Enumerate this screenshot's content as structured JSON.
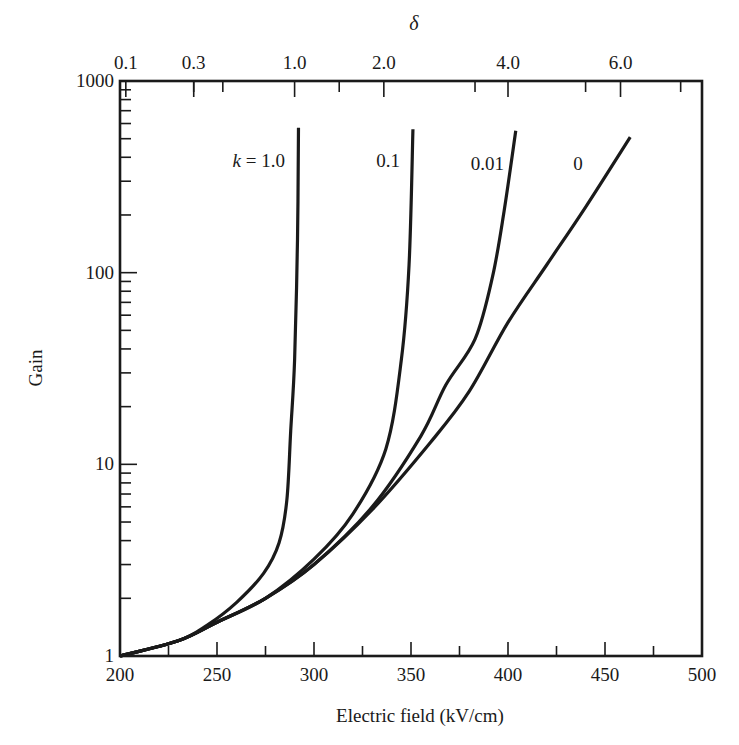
{
  "chart_data": {
    "type": "line",
    "title": "",
    "xlabel": "Electric field (kV/cm)",
    "ylabel": "Gain",
    "xlim": [
      200,
      500
    ],
    "ylim": [
      1,
      1000
    ],
    "yscale": "log",
    "grid": false,
    "legend": "inline labels near top of each curve",
    "x_ticks": [
      200,
      250,
      300,
      350,
      400,
      450,
      500
    ],
    "x_tick_labels": [
      "200",
      "250",
      "300",
      "350",
      "400",
      "450",
      "500"
    ],
    "y_ticks": [
      1,
      10,
      100,
      1000
    ],
    "y_tick_labels": [
      "1",
      "10",
      "100",
      "1000"
    ],
    "secondary_x_axis": {
      "label": "δ",
      "position": "top",
      "ticks": [
        {
          "label": "0.1",
          "x": 203
        },
        {
          "label": "0.3",
          "x": 238
        },
        {
          "label": "1.0",
          "x": 290
        },
        {
          "label": "2.0",
          "x": 336
        },
        {
          "label": "4.0",
          "x": 400
        },
        {
          "label": "6.0",
          "x": 458
        }
      ]
    },
    "series": [
      {
        "name": "k = 1.0",
        "label": "k = 1.0",
        "x": [
          200,
          230,
          245,
          260,
          274,
          282,
          286,
          288,
          290,
          291.5,
          292
        ],
        "y": [
          1.0,
          1.2,
          1.45,
          1.9,
          2.7,
          3.9,
          6.5,
          15,
          35,
          150,
          570
        ]
      },
      {
        "name": "k = 0.1",
        "label": "0.1",
        "x": [
          200,
          230,
          250,
          275,
          300,
          320,
          337,
          345,
          349,
          351
        ],
        "y": [
          1.0,
          1.2,
          1.5,
          2.0,
          3.2,
          5.5,
          12,
          35,
          110,
          560
        ]
      },
      {
        "name": "k = 0.01",
        "label": "0.01",
        "x": [
          200,
          230,
          250,
          275,
          300,
          330,
          355,
          368,
          383,
          392,
          398,
          404
        ],
        "y": [
          1.0,
          1.2,
          1.5,
          2.0,
          3.0,
          6.0,
          14,
          26,
          45,
          95,
          210,
          550
        ]
      },
      {
        "name": "k = 0",
        "label": "0",
        "x": [
          200,
          230,
          250,
          275,
          300,
          330,
          360,
          380,
          400,
          420,
          440,
          463
        ],
        "y": [
          1.0,
          1.2,
          1.5,
          2.0,
          3.0,
          5.8,
          13,
          24,
          55,
          110,
          220,
          510
        ]
      }
    ]
  }
}
